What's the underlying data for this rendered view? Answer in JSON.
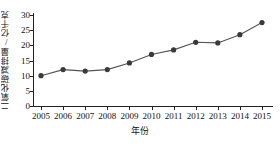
{
  "chart_data": {
    "type": "line",
    "title": "",
    "xlabel": "年份",
    "ylabel": "二氧化碳减排量/亿千克",
    "categories": [
      "2005",
      "2006",
      "2007",
      "2008",
      "2009",
      "2010",
      "2011",
      "2012",
      "2013",
      "2014",
      "2015"
    ],
    "values": [
      10,
      12,
      11.5,
      12,
      14.2,
      17,
      18.5,
      21,
      20.8,
      23.5,
      27.5
    ],
    "x": [
      2005,
      2006,
      2007,
      2008,
      2009,
      2010,
      2011,
      2012,
      2013,
      2014,
      2015
    ],
    "ylim": [
      0,
      30
    ],
    "yticks": [
      0,
      5,
      10,
      15,
      20,
      25,
      30
    ],
    "ytick_labels": [
      "0",
      "5",
      "10",
      "15",
      "20",
      "25",
      "30"
    ],
    "xlim": [
      2005,
      2015
    ],
    "grid": false,
    "legend": null,
    "series": [
      {
        "name": "二氧化碳减排量",
        "values": [
          10,
          12,
          11.5,
          12,
          14.2,
          17,
          18.5,
          21,
          20.8,
          23.5,
          27.5
        ],
        "marker": "filled-circle",
        "line_color": "#555555",
        "marker_color": "#3a3a3a"
      }
    ]
  },
  "colors": {
    "axis": "#222222",
    "line": "#555555",
    "marker": "#3a3a3a",
    "text": "#111111",
    "background": "#ffffff"
  }
}
